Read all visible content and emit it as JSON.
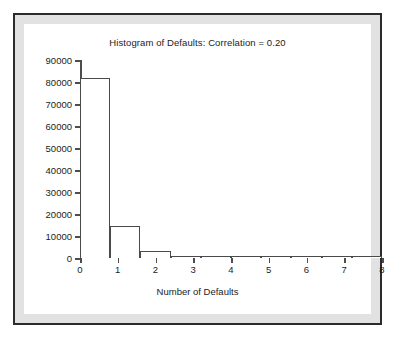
{
  "figure": {
    "title": "Histogram of Defaults: Correlation = 0.20",
    "x_axis_title": "Number of Defaults",
    "frame_color": "#2b2b2b",
    "mat_color": "#e2e2e2",
    "plot_background": "#ffffff",
    "axis_color": "#4d4d4d",
    "bar_outline_color": "#4a4a4a",
    "bar_fill_color": "#ffffff"
  },
  "chart_data": {
    "type": "bar",
    "title": "Histogram of Defaults: Correlation = 0.20",
    "xlabel": "Number of Defaults",
    "ylabel": "",
    "xlim": [
      0,
      8
    ],
    "ylim": [
      0,
      90000
    ],
    "grid": false,
    "legend": false,
    "bin_width": 0.8,
    "x_ticks": [
      0,
      1,
      2,
      3,
      4,
      5,
      6,
      7,
      8
    ],
    "x_tick_labels": [
      "0",
      "1",
      "2",
      "3",
      "4",
      "5",
      "6",
      "7",
      "8"
    ],
    "y_ticks": [
      0,
      10000,
      20000,
      30000,
      40000,
      50000,
      60000,
      70000,
      80000,
      90000
    ],
    "y_tick_labels": [
      "0",
      "10000",
      "20000",
      "30000",
      "40000",
      "50000",
      "60000",
      "70000",
      "80000",
      "90000"
    ],
    "bins": [
      {
        "start": 0.0,
        "end": 0.8,
        "value": 82000
      },
      {
        "start": 0.8,
        "end": 1.6,
        "value": 14500
      },
      {
        "start": 1.6,
        "end": 2.4,
        "value": 3200
      },
      {
        "start": 2.4,
        "end": 3.2,
        "value": 700
      },
      {
        "start": 3.2,
        "end": 4.0,
        "value": 120
      },
      {
        "start": 4.0,
        "end": 4.8,
        "value": 40
      },
      {
        "start": 4.8,
        "end": 5.6,
        "value": 15
      },
      {
        "start": 5.6,
        "end": 6.4,
        "value": 8
      },
      {
        "start": 6.4,
        "end": 7.2,
        "value": 4
      },
      {
        "start": 7.2,
        "end": 8.0,
        "value": 2
      }
    ],
    "categories": [
      "0-0.8",
      "0.8-1.6",
      "1.6-2.4",
      "2.4-3.2",
      "3.2-4.0",
      "4.0-4.8",
      "4.8-5.6",
      "5.6-6.4",
      "6.4-7.2",
      "7.2-8.0"
    ],
    "values": [
      82000,
      14500,
      3200,
      700,
      120,
      40,
      15,
      8,
      4,
      2
    ]
  }
}
